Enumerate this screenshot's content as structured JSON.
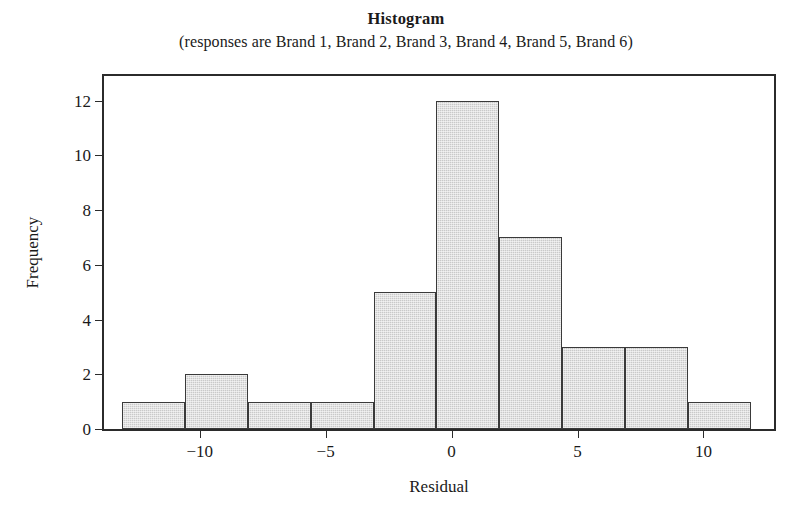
{
  "chart_data": {
    "type": "bar",
    "title": "Histogram",
    "subtitle": "(responses are Brand 1, Brand 2, Brand 3, Brand 4, Brand 5, Brand 6)",
    "xlabel": "Residual",
    "ylabel": "Frequency",
    "grid": false,
    "legend": "none",
    "xlim": [
      -13.8,
      12.8
    ],
    "ylim": [
      0,
      12.9
    ],
    "xticks": [
      -10,
      -5,
      0,
      5,
      10
    ],
    "xtick_labels": [
      "−10",
      "−5",
      "0",
      "5",
      "10"
    ],
    "yticks": [
      0,
      2,
      4,
      6,
      8,
      10,
      12
    ],
    "ytick_labels": [
      "0",
      "2",
      "4",
      "6",
      "8",
      "10",
      "12"
    ],
    "bin_width": 2.5,
    "bin_edges": [
      -13.1,
      -10.6,
      -8.1,
      -5.6,
      -3.1,
      -0.6,
      1.9,
      4.4,
      6.9,
      9.4,
      11.9
    ],
    "bin_centers": [
      -11.85,
      -9.35,
      -6.85,
      -4.35,
      -1.85,
      0.65,
      3.15,
      5.65,
      8.15,
      10.65
    ],
    "values": [
      1,
      2,
      1,
      1,
      5,
      12,
      7,
      3,
      3,
      1
    ],
    "categories": [
      "-13.1 to -10.6",
      "-10.6 to -8.1",
      "-8.1 to -5.6",
      "-5.6 to -3.1",
      "-3.1 to -0.6",
      "-0.6 to 1.9",
      "1.9 to 4.4",
      "4.4 to 6.9",
      "6.9 to 9.4",
      "9.4 to 11.9"
    ],
    "bar_fill_color": "#c9c9c9",
    "bar_edge_color": "#3a3a3a",
    "axis_color": "#2b2b2b",
    "background_color": "#ffffff"
  }
}
